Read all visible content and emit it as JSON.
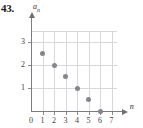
{
  "problem": {
    "number": "43."
  },
  "chart_data": {
    "type": "scatter",
    "title": "",
    "xlabel": "n",
    "ylabel": "a_n",
    "ylabel_base": "a",
    "ylabel_sub": "n",
    "x": [
      1,
      2,
      3,
      4,
      5,
      6
    ],
    "values": [
      2.5,
      2,
      1.5,
      1,
      0.5,
      0
    ],
    "points": [
      {
        "n": 1,
        "a": 2.5
      },
      {
        "n": 2,
        "a": 2
      },
      {
        "n": 3,
        "a": 1.5
      },
      {
        "n": 4,
        "a": 1
      },
      {
        "n": 5,
        "a": 0.5
      },
      {
        "n": 6,
        "a": 0
      }
    ],
    "xlim": [
      0,
      7.6
    ],
    "ylim": [
      0,
      3.6
    ],
    "xticks": [
      0,
      1,
      2,
      3,
      4,
      5,
      6,
      7
    ],
    "xtick_labels": [
      "0",
      "1",
      "2",
      "3",
      "4",
      "5",
      "6",
      "7"
    ],
    "yticks": [
      1,
      2,
      3
    ],
    "ytick_labels": [
      "1",
      "2",
      "3"
    ],
    "grid": true,
    "grid_x": [
      1,
      2,
      3,
      4,
      5,
      6,
      7
    ],
    "grid_y": [
      1,
      2,
      3
    ],
    "legend": false,
    "colors": {
      "point": "#85858b",
      "grid": "#d8d8dc",
      "axis": "#7b7b80",
      "text": "#2b2b30"
    }
  }
}
